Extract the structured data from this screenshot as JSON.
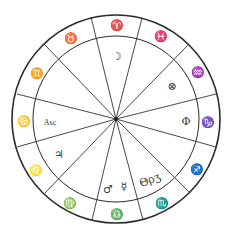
{
  "diagram": {
    "type": "astrological-chart-wheel",
    "colors": {
      "line": "#2b2b2b",
      "glyph": "#3a3a3a",
      "background": "#ffffff"
    },
    "signs": [
      {
        "name": "aries",
        "glyph": "♈"
      },
      {
        "name": "pisces",
        "glyph": "♓"
      },
      {
        "name": "aquarius",
        "glyph": "♒"
      },
      {
        "name": "capricorn",
        "glyph": "♑"
      },
      {
        "name": "sagittarius",
        "glyph": "♐"
      },
      {
        "name": "scorpio",
        "glyph": "♏"
      },
      {
        "name": "libra",
        "glyph": "♎"
      },
      {
        "name": "virgo",
        "glyph": "♍"
      },
      {
        "name": "leo",
        "glyph": "♌"
      },
      {
        "name": "cancer",
        "glyph": "♋"
      },
      {
        "name": "gemini",
        "glyph": "♊"
      },
      {
        "name": "taurus",
        "glyph": "♉"
      }
    ],
    "houses": [
      {
        "position": "top",
        "contents": [
          "☽"
        ]
      },
      {
        "position": "upper-right",
        "contents": [
          "⊗"
        ]
      },
      {
        "position": "right",
        "contents": [
          "Φ"
        ]
      },
      {
        "position": "lower-right",
        "contents": [
          "Θ",
          "ρ",
          "ʒ"
        ]
      },
      {
        "position": "bottom",
        "contents": [
          "♂",
          "☿"
        ]
      },
      {
        "position": "lower-left",
        "contents": [
          "♃"
        ]
      },
      {
        "position": "left",
        "contents": [
          "Asc"
        ]
      }
    ],
    "labels": {
      "moon": "☽",
      "part_of_fortune": "⊗",
      "phi": "Φ",
      "theta_rho": "Θρʒ",
      "mars": "♂",
      "mercury": "☿",
      "jupiter": "♃",
      "ascendant": "Asc"
    }
  }
}
